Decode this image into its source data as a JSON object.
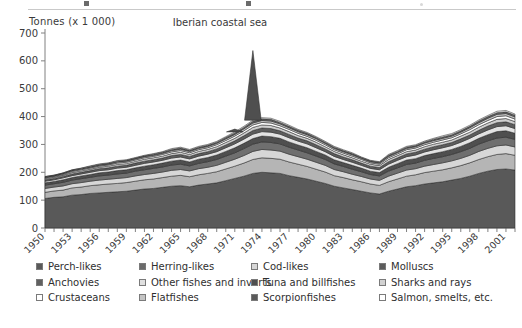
{
  "figure": {
    "axis_unit_label": "Tonnes (x 1 000)",
    "title": "Iberian coastal sea"
  },
  "chart_data": {
    "type": "area",
    "stacked": true,
    "title": "Iberian coastal sea",
    "xlabel": "",
    "ylabel": "Tonnes (x 1 000)",
    "ylim": [
      0,
      700
    ],
    "ytick_values": [
      0,
      100,
      200,
      300,
      400,
      500,
      600,
      700
    ],
    "grid": false,
    "legend_position": "bottom",
    "xlim": [
      1950,
      2002
    ],
    "xtick_labels": [
      "1950",
      "1953",
      "1956",
      "1959",
      "1962",
      "1965",
      "1968",
      "1971",
      "1974",
      "1977",
      "1980",
      "1983",
      "1986",
      "1989",
      "1992",
      "1995",
      "1998",
      "2001"
    ],
    "x": [
      1950,
      1951,
      1952,
      1953,
      1954,
      1955,
      1956,
      1957,
      1958,
      1959,
      1960,
      1961,
      1962,
      1963,
      1964,
      1965,
      1966,
      1967,
      1968,
      1969,
      1970,
      1971,
      1972,
      1973,
      1974,
      1975,
      1976,
      1977,
      1978,
      1979,
      1980,
      1981,
      1982,
      1983,
      1984,
      1985,
      1986,
      1987,
      1988,
      1989,
      1990,
      1991,
      1992,
      1993,
      1994,
      1995,
      1996,
      1997,
      1998,
      1999,
      2000,
      2001,
      2002
    ],
    "series": [
      {
        "name": "Perch-likes",
        "color": "#595959",
        "values": [
          106,
          110,
          112,
          118,
          120,
          124,
          126,
          128,
          130,
          132,
          136,
          140,
          142,
          146,
          150,
          152,
          148,
          154,
          158,
          162,
          170,
          178,
          186,
          196,
          200,
          198,
          196,
          188,
          182,
          176,
          168,
          160,
          150,
          144,
          138,
          132,
          126,
          122,
          132,
          140,
          148,
          152,
          158,
          162,
          166,
          172,
          178,
          186,
          196,
          204,
          210,
          212,
          208
        ]
      },
      {
        "name": "Herring-likes",
        "color": "#b5b5b5",
        "values": [
          22,
          23,
          24,
          26,
          27,
          28,
          29,
          30,
          30,
          31,
          32,
          33,
          34,
          35,
          36,
          37,
          36,
          37,
          38,
          40,
          42,
          44,
          47,
          50,
          52,
          52,
          51,
          49,
          47,
          45,
          43,
          41,
          38,
          37,
          35,
          34,
          32,
          31,
          34,
          36,
          38,
          39,
          41,
          42,
          43,
          44,
          46,
          48,
          50,
          52,
          54,
          55,
          53
        ]
      },
      {
        "name": "Cod-likes",
        "color": "#d7d7d7",
        "values": [
          14,
          14,
          15,
          15,
          16,
          16,
          17,
          17,
          18,
          18,
          19,
          19,
          20,
          20,
          21,
          21,
          21,
          22,
          22,
          23,
          24,
          25,
          27,
          29,
          30,
          30,
          29,
          28,
          27,
          26,
          25,
          24,
          22,
          21,
          20,
          19,
          18,
          18,
          20,
          21,
          22,
          22,
          23,
          24,
          25,
          25,
          26,
          27,
          29,
          30,
          31,
          31,
          30
        ]
      },
      {
        "name": "Molluscs",
        "color": "#6f6f6f",
        "values": [
          12,
          12,
          13,
          13,
          14,
          14,
          15,
          15,
          16,
          16,
          17,
          17,
          18,
          18,
          19,
          19,
          18,
          19,
          20,
          21,
          22,
          23,
          25,
          26,
          27,
          27,
          26,
          25,
          24,
          23,
          22,
          21,
          20,
          19,
          18,
          17,
          16,
          16,
          18,
          19,
          20,
          20,
          21,
          22,
          22,
          23,
          24,
          25,
          26,
          27,
          28,
          28,
          27
        ]
      },
      {
        "name": "Anchovies",
        "color": "#4f4f4f",
        "values": [
          8,
          8,
          9,
          9,
          10,
          10,
          11,
          11,
          12,
          12,
          12,
          13,
          13,
          14,
          14,
          15,
          14,
          15,
          15,
          16,
          17,
          18,
          19,
          20,
          21,
          21,
          20,
          19,
          18,
          18,
          17,
          16,
          15,
          14,
          14,
          13,
          12,
          12,
          14,
          15,
          16,
          16,
          17,
          17,
          18,
          18,
          19,
          20,
          21,
          22,
          23,
          23,
          22
        ]
      },
      {
        "name": "Other fishes and inverts",
        "color": "#e3e3e3",
        "values": [
          6,
          6,
          7,
          7,
          7,
          8,
          8,
          8,
          9,
          9,
          9,
          10,
          10,
          10,
          11,
          11,
          11,
          11,
          12,
          12,
          13,
          14,
          15,
          16,
          16,
          16,
          15,
          15,
          14,
          14,
          13,
          12,
          12,
          11,
          11,
          10,
          10,
          10,
          11,
          12,
          12,
          13,
          13,
          14,
          14,
          14,
          15,
          16,
          16,
          17,
          18,
          18,
          17
        ]
      },
      {
        "name": "Tuna and billfishes",
        "color": "#5d5d5d",
        "values": [
          5,
          5,
          5,
          6,
          6,
          6,
          7,
          7,
          7,
          7,
          8,
          8,
          8,
          8,
          9,
          9,
          9,
          9,
          9,
          10,
          10,
          11,
          12,
          13,
          13,
          13,
          12,
          12,
          11,
          11,
          11,
          10,
          10,
          9,
          9,
          8,
          8,
          8,
          9,
          9,
          10,
          10,
          10,
          11,
          11,
          11,
          12,
          12,
          13,
          14,
          14,
          14,
          14
        ]
      },
      {
        "name": "Sharks and rays",
        "color": "#cfcfcf",
        "values": [
          4,
          4,
          4,
          5,
          5,
          5,
          5,
          6,
          6,
          6,
          6,
          7,
          7,
          7,
          7,
          8,
          7,
          8,
          8,
          8,
          9,
          9,
          10,
          11,
          11,
          11,
          10,
          10,
          9,
          9,
          9,
          8,
          8,
          8,
          7,
          7,
          7,
          7,
          8,
          8,
          8,
          8,
          9,
          9,
          9,
          9,
          10,
          10,
          11,
          11,
          12,
          12,
          11
        ]
      },
      {
        "name": "Crustaceans",
        "color": "#ffffff",
        "values": [
          3,
          3,
          3,
          4,
          4,
          4,
          4,
          4,
          5,
          5,
          5,
          5,
          5,
          6,
          6,
          6,
          6,
          6,
          6,
          7,
          7,
          8,
          8,
          9,
          9,
          9,
          8,
          8,
          8,
          7,
          7,
          7,
          6,
          6,
          6,
          6,
          5,
          5,
          6,
          6,
          7,
          7,
          7,
          7,
          8,
          8,
          8,
          9,
          9,
          9,
          10,
          10,
          9
        ]
      },
      {
        "name": "Flatfishes",
        "color": "#c4c4c4",
        "values": [
          2,
          2,
          3,
          3,
          3,
          3,
          3,
          3,
          4,
          4,
          4,
          4,
          4,
          4,
          5,
          5,
          5,
          5,
          5,
          5,
          6,
          6,
          7,
          7,
          7,
          7,
          7,
          6,
          6,
          6,
          6,
          5,
          5,
          5,
          5,
          4,
          4,
          4,
          5,
          5,
          5,
          5,
          6,
          6,
          6,
          6,
          6,
          7,
          7,
          8,
          8,
          8,
          8
        ]
      },
      {
        "name": "Scorpionfishes",
        "color": "#666666",
        "values": [
          2,
          2,
          2,
          2,
          2,
          3,
          3,
          3,
          3,
          3,
          3,
          3,
          4,
          4,
          4,
          4,
          4,
          4,
          4,
          4,
          5,
          5,
          5,
          6,
          6,
          6,
          5,
          5,
          5,
          5,
          4,
          4,
          4,
          4,
          4,
          3,
          3,
          3,
          4,
          4,
          4,
          4,
          4,
          5,
          5,
          5,
          5,
          5,
          6,
          6,
          6,
          6,
          6
        ]
      },
      {
        "name": "Salmon, smelts, etc.",
        "color": "#fbfbfb",
        "values": [
          1,
          1,
          1,
          1,
          1,
          2,
          2,
          2,
          2,
          2,
          2,
          2,
          2,
          2,
          3,
          3,
          3,
          3,
          3,
          3,
          3,
          4,
          4,
          4,
          4,
          4,
          4,
          4,
          3,
          3,
          3,
          3,
          3,
          3,
          3,
          2,
          2,
          2,
          3,
          3,
          3,
          3,
          3,
          3,
          4,
          4,
          4,
          4,
          4,
          4,
          5,
          5,
          4
        ]
      },
      {
        "name": "Anchovy spike",
        "color": "#4f4f4f",
        "hidden": true,
        "values": [
          0,
          0,
          0,
          0,
          0,
          0,
          0,
          0,
          0,
          0,
          0,
          0,
          0,
          0,
          0,
          0,
          0,
          0,
          0,
          0,
          0,
          10,
          0,
          250,
          0,
          0,
          0,
          0,
          0,
          0,
          0,
          0,
          0,
          0,
          0,
          0,
          0,
          0,
          0,
          0,
          0,
          0,
          0,
          0,
          0,
          0,
          0,
          0,
          0,
          0,
          0,
          0,
          0
        ]
      }
    ]
  },
  "legend": {
    "rows": [
      [
        {
          "label": "Perch-likes",
          "color": "#595959"
        },
        {
          "label": "Herring-likes",
          "color": "#6b6b6b"
        },
        {
          "label": "Cod-likes",
          "color": "#d7d7d7"
        },
        {
          "label": "Molluscs",
          "color": "#5c5c5c"
        }
      ],
      [
        {
          "label": "Anchovies",
          "color": "#606060"
        },
        {
          "label": "Other fishes and inverts",
          "color": "#e0e0e0"
        },
        {
          "label": "Tuna and billfishes",
          "color": "#4f4f4f"
        },
        {
          "label": "Sharks and rays",
          "color": "#d2d2d2"
        }
      ],
      [
        {
          "label": "Crustaceans",
          "color": "#ffffff"
        },
        {
          "label": "Flatfishes",
          "color": "#c4c4c4"
        },
        {
          "label": "Scorpionfishes",
          "color": "#5a5a5a"
        },
        {
          "label": "Salmon, smelts, etc.",
          "color": "#ffffff"
        }
      ]
    ]
  }
}
